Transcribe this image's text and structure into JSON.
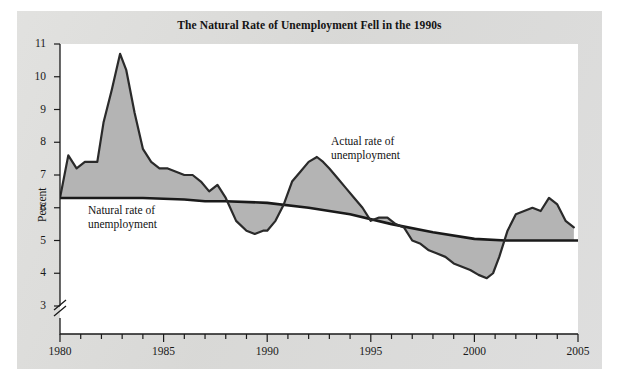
{
  "figure": {
    "title": "The Natural Rate of Unemployment Fell in the 1990s",
    "background_color": "#dcdcda",
    "plot_background_color": "#ffffff",
    "fill_color": "#b4b4b4",
    "line_color": "#1a1a1a"
  },
  "annotations": {
    "natural": "Natural rate of\nunemployment",
    "actual": "Actual rate of\nunemployment"
  },
  "axes": {
    "y_title": "Percent",
    "y_ticks": [
      "11",
      "10",
      "9",
      "8",
      "7",
      "6",
      "5",
      "4",
      "3"
    ],
    "x_ticks": [
      "1980",
      "1985",
      "1990",
      "1995",
      "2000",
      "2005"
    ],
    "axis_break": "zigzag-break-below-3"
  },
  "chart_data": {
    "type": "area",
    "title": "The Natural Rate of Unemployment Fell in the 1990s",
    "xlabel": "",
    "ylabel": "Percent",
    "xlim": [
      1980,
      2005
    ],
    "ylim": [
      2.6,
      11
    ],
    "y_axis_break_below": 3,
    "grid": false,
    "legend": "annotated-inline",
    "x_tick_interval_minor": 1,
    "x_tick_interval_major": 5,
    "series": [
      {
        "name": "Actual rate of unemployment",
        "style": "thick-line-with-shaded-gap",
        "x": [
          1980.0,
          1980.4,
          1980.8,
          1981.2,
          1981.5,
          1981.8,
          1982.1,
          1982.5,
          1982.9,
          1983.2,
          1983.6,
          1984.0,
          1984.4,
          1984.8,
          1985.2,
          1985.6,
          1986.0,
          1986.4,
          1986.8,
          1987.2,
          1987.6,
          1988.0,
          1988.5,
          1989.0,
          1989.4,
          1989.8,
          1990.0,
          1990.4,
          1990.8,
          1991.2,
          1991.6,
          1992.0,
          1992.4,
          1992.7,
          1993.0,
          1993.4,
          1993.8,
          1994.2,
          1994.6,
          1995.0,
          1995.4,
          1995.8,
          1996.2,
          1996.6,
          1997.0,
          1997.4,
          1997.8,
          1998.2,
          1998.6,
          1999.0,
          1999.4,
          1999.8,
          2000.2,
          2000.6,
          2000.9,
          2001.2,
          2001.6,
          2002.0,
          2002.4,
          2002.8,
          2003.2,
          2003.6,
          2004.0,
          2004.4,
          2004.8
        ],
        "y": [
          6.3,
          7.6,
          7.2,
          7.4,
          7.4,
          7.4,
          8.6,
          9.6,
          10.7,
          10.2,
          8.9,
          7.8,
          7.4,
          7.2,
          7.2,
          7.1,
          7.0,
          7.0,
          6.8,
          6.5,
          6.7,
          6.3,
          5.6,
          5.3,
          5.2,
          5.3,
          5.3,
          5.6,
          6.1,
          6.8,
          7.1,
          7.4,
          7.55,
          7.4,
          7.2,
          6.9,
          6.6,
          6.3,
          6.0,
          5.6,
          5.7,
          5.7,
          5.5,
          5.4,
          5.0,
          4.9,
          4.7,
          4.6,
          4.5,
          4.3,
          4.2,
          4.1,
          3.95,
          3.85,
          4.0,
          4.5,
          5.3,
          5.8,
          5.9,
          6.0,
          5.9,
          6.3,
          6.1,
          5.6,
          5.4
        ]
      },
      {
        "name": "Natural rate of unemployment",
        "style": "thick-line",
        "x": [
          1980,
          1982,
          1984,
          1986,
          1987,
          1988,
          1990,
          1992,
          1994,
          1996,
          1998,
          2000,
          2001.5,
          2003,
          2005
        ],
        "y": [
          6.3,
          6.3,
          6.3,
          6.25,
          6.2,
          6.2,
          6.15,
          6.0,
          5.8,
          5.5,
          5.25,
          5.05,
          5.0,
          5.0,
          5.0
        ]
      }
    ]
  }
}
